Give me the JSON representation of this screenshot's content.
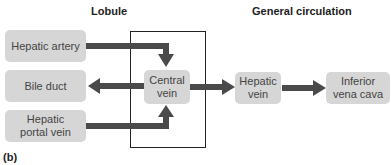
{
  "headers": {
    "lobule": "Lobule",
    "general_circulation": "General circulation"
  },
  "nodes": {
    "hepatic_artery": "Hepatic artery",
    "bile_duct": "Bile duct",
    "hepatic_portal_vein": "Hepatic portal vein",
    "central_vein": "Central vein",
    "hepatic_vein": "Hepatic vein",
    "inferior_vena_cava": "Inferior vena cava"
  },
  "edges": [
    {
      "from": "Hepatic artery",
      "to": "Central vein"
    },
    {
      "from": "Hepatic portal vein",
      "to": "Central vein"
    },
    {
      "from": "Central vein",
      "to": "Bile duct"
    },
    {
      "from": "Central vein",
      "to": "Hepatic vein"
    },
    {
      "from": "Hepatic vein",
      "to": "Inferior vena cava"
    }
  ],
  "panel_label": "(b)",
  "colors": {
    "box_fill": "#d6d6d6",
    "arrow": "#4a4a4a",
    "frame": "#222222"
  }
}
